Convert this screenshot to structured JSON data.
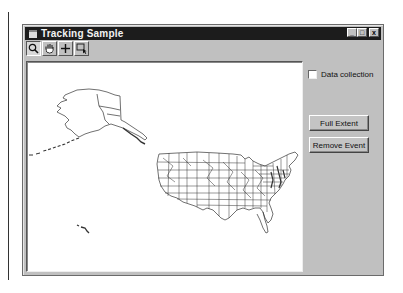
{
  "window": {
    "title": "Tracking Sample",
    "controls": {
      "minimize": "_",
      "maximize": "□",
      "close": "x"
    }
  },
  "toolbar": {
    "tools": [
      {
        "name": "zoom-in-tool",
        "icon": "magnifier-icon",
        "active": true
      },
      {
        "name": "pan-tool",
        "icon": "hand-icon",
        "active": false
      },
      {
        "name": "move-tool",
        "icon": "crosshair-icon",
        "active": false
      },
      {
        "name": "select-tool",
        "icon": "rect-select-icon",
        "active": false
      }
    ]
  },
  "map": {
    "layer": "United States states",
    "background": "#ffffff"
  },
  "panel": {
    "data_collection_label": "Data collection",
    "data_collection_checked": false,
    "full_extent_label": "Full Extent",
    "remove_event_label": "Remove Event"
  },
  "colors": {
    "titlebar": "#1c1c1c",
    "face": "#c0c0c0",
    "map_lines": "#333333"
  }
}
